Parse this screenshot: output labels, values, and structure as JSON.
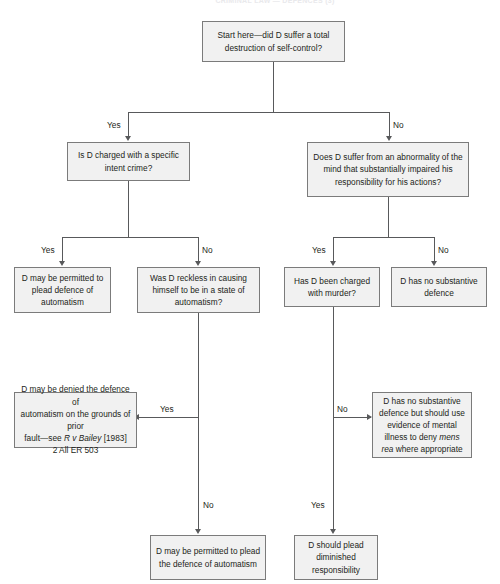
{
  "title": "CRIMINAL LAW — DEFENCES (3)",
  "nodes": {
    "start": "Start here—did D suffer a total destruction of self-control?",
    "specific_intent": "Is D charged with a specific intent crime?",
    "abnormality": "Does D suffer from an abnormality of the mind that substantially impaired his responsibility for his actions?",
    "permitted_automatism": "D may be permitted to plead defence of automatism",
    "reckless": "Was D reckless in causing himself to be in a state of automatism?",
    "charged_murder": "Has D been charged with murder?",
    "no_substantive": "D has no substantive defence",
    "denied_prior_fault_1": "D may be denied the defence of",
    "denied_prior_fault_2": "automatism on the grounds of prior",
    "denied_prior_fault_3a": "fault—see ",
    "denied_prior_fault_3b": "R v Bailey",
    "denied_prior_fault_3c": " [1983]",
    "denied_prior_fault_4": "2 All ER 503",
    "mens_rea_1": "D has no substantive",
    "mens_rea_2": "defence but should use",
    "mens_rea_3": "evidence of mental",
    "mens_rea_4a": "illness to deny ",
    "mens_rea_4b": "mens",
    "mens_rea_5a": "rea",
    "mens_rea_5b": " where appropriate",
    "permitted_plead": "D may be permitted to plead the defence of automatism",
    "diminished": "D should plead diminished responsibility"
  },
  "edges": {
    "yes_1": "Yes",
    "no_1": "No",
    "yes_2": "Yes",
    "no_2": "No",
    "yes_3": "Yes",
    "no_3": "No",
    "yes_4": "Yes",
    "no_4": "No",
    "no_5": "No",
    "yes_5": "Yes"
  },
  "colors": {
    "node_fill": "#f1f1f1",
    "node_border": "#7b7b7b",
    "connector": "#58595b",
    "text": "#231f20",
    "background": "#ffffff"
  }
}
